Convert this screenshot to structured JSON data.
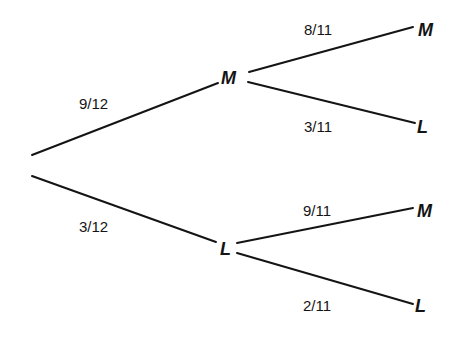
{
  "diagram": {
    "type": "probability-tree",
    "root": {
      "branches": [
        {
          "probability": "9/12",
          "outcome": "M",
          "branches": [
            {
              "probability": "8/11",
              "outcome": "M"
            },
            {
              "probability": "3/11",
              "outcome": "L"
            }
          ]
        },
        {
          "probability": "3/12",
          "outcome": "L",
          "branches": [
            {
              "probability": "9/11",
              "outcome": "M"
            },
            {
              "probability": "2/11",
              "outcome": "L"
            }
          ]
        }
      ]
    },
    "line_color": "#141414",
    "background": "#ffffff"
  }
}
